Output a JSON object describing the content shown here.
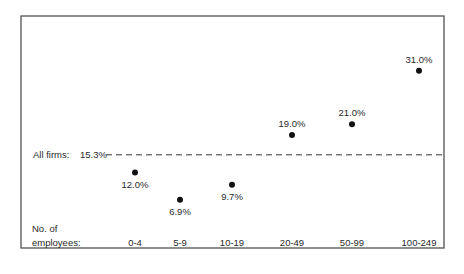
{
  "chart_data": {
    "type": "scatter",
    "title": "",
    "xlabel": "No. of employees:",
    "xlabel_lines": [
      "No. of",
      "employees:"
    ],
    "ylabel": "",
    "categories": [
      "0-4",
      "5-9",
      "10-19",
      "20-49",
      "50-99",
      "100-249"
    ],
    "values": [
      12.0,
      6.9,
      9.7,
      19.0,
      21.0,
      31.0
    ],
    "data_labels": [
      "12.0%",
      "6.9%",
      "9.7%",
      "19.0%",
      "21.0%",
      "31.0%"
    ],
    "label_position": [
      "below",
      "below",
      "below",
      "above",
      "above",
      "above"
    ],
    "reference_line": {
      "label": "All firms:",
      "value": 15.3,
      "value_label": "15.3%",
      "style": "dashed"
    },
    "ylim": [
      5,
      33
    ],
    "grid": false,
    "legend": "none",
    "colors": {
      "marker": "#111111",
      "frame": "#444444",
      "text": "#2a2a2a"
    }
  }
}
